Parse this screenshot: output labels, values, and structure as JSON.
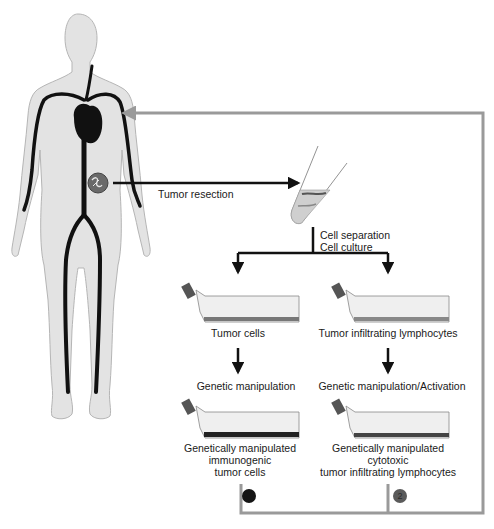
{
  "figure": {
    "type": "adoptive immunotherapy workflow diagram",
    "colors": {
      "body_fill": "#e3e3e3",
      "body_outline": "#b5b5b5",
      "vessels": "#111111",
      "return_frame": "#9a9a9a",
      "arrows": "#111111",
      "badge_1": "#151515",
      "badge_2": "#5a5a5a"
    }
  },
  "labels": {
    "tumor_resection": "Tumor resection",
    "cell_separation": "Cell separation",
    "cell_culture": "Cell culture",
    "left_flask_1": "Tumor cells",
    "right_flask_1": "Tumor infiltrating lymphocytes",
    "left_step": "Genetic manipulation",
    "right_step": "Genetic manipulation/Activation",
    "left_flask_2_line1": "Genetically manipulated",
    "left_flask_2_line2": "immunogenic",
    "left_flask_2_line3": "tumor cells",
    "right_flask_2_line1": "Genetically manipulated",
    "right_flask_2_line2": "cytotoxic",
    "right_flask_2_line3": "tumor infiltrating lymphocytes"
  },
  "badges": [
    {
      "number": "1"
    },
    {
      "number": "2"
    }
  ],
  "icons": {
    "human_body": "human-silhouette-icon",
    "heart": "heart-icon",
    "tumor": "tumor-icon",
    "test_tube": "test-tube-icon",
    "culture_flask": "culture-flask-icon"
  }
}
